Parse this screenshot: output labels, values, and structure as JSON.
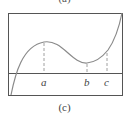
{
  "top_caption": "(a)",
  "caption": "(c)",
  "axis_labels": [
    "a",
    "b",
    "c"
  ],
  "colors": {
    "frame": "#555555",
    "curve": "#888888",
    "dashes": "#888888",
    "text": "#444444"
  }
}
